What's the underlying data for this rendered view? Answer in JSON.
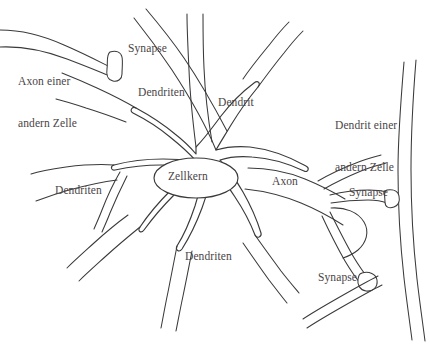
{
  "figure": {
    "language": "de",
    "background_color": "#ffffff",
    "stroke_color": "#3a3a3a",
    "text_color": "#4a4446"
  },
  "labels": [
    {
      "id": "axon-einer-andern-zelle",
      "name": "label-axon-other-cell",
      "text": "Axon einer\nandern Zelle",
      "lines": [
        "Axon einer",
        "andern Zelle"
      ],
      "x": 18,
      "y": 46
    },
    {
      "id": "synapse-top",
      "name": "label-synapse-top",
      "text": "Synapse",
      "lines": [
        "Synapse"
      ],
      "x": 128,
      "y": 42
    },
    {
      "id": "dendriten-top",
      "name": "label-dendriten-top",
      "text": "Dendriten",
      "lines": [
        "Dendriten"
      ],
      "x": 138,
      "y": 86
    },
    {
      "id": "dendrit-top-right",
      "name": "label-dendrit",
      "text": "Dendrit",
      "lines": [
        "Dendrit"
      ],
      "x": 218,
      "y": 96
    },
    {
      "id": "dendrit-einer-andern-zelle",
      "name": "label-dendrit-other-cell",
      "text": "Dendrit einer\nandern Zelle",
      "lines": [
        "Dendrit einer",
        "andern Zelle"
      ],
      "x": 335,
      "y": 90
    },
    {
      "id": "zellkern",
      "name": "label-zellkern",
      "text": "Zellkern",
      "lines": [
        "Zellkern"
      ],
      "x": 168,
      "y": 167
    },
    {
      "id": "dendriten-left",
      "name": "label-dendriten-left",
      "text": "Dendriten",
      "lines": [
        "Dendriten"
      ],
      "x": 55,
      "y": 184
    },
    {
      "id": "axon",
      "name": "label-axon",
      "text": "Axon",
      "lines": [
        "Axon"
      ],
      "x": 272,
      "y": 175
    },
    {
      "id": "synapse-right",
      "name": "label-synapse-right",
      "text": "Synapse",
      "lines": [
        "Synapse"
      ],
      "x": 349,
      "y": 186
    },
    {
      "id": "dendriten-bottom",
      "name": "label-dendriten-bottom",
      "text": "Dendriten",
      "lines": [
        "Dendriten"
      ],
      "x": 185,
      "y": 250
    },
    {
      "id": "synapse-bottom",
      "name": "label-synapse-bottom",
      "text": "Synapse",
      "lines": [
        "Synapse"
      ],
      "x": 318,
      "y": 271
    }
  ],
  "structures": {
    "soma": "star-shaped cell body with radiating dendrite branches",
    "nucleus": "central ellipse labelled Zellkern",
    "axon": "long process extending to the right, branching to terminals",
    "synapse_count": 3,
    "dendrite_branches": 8,
    "external_axon": "incoming axon from another cell ending in a terminal bulb at upper left",
    "external_dendrite": "vertical dendrite of another cell along the right edge"
  }
}
